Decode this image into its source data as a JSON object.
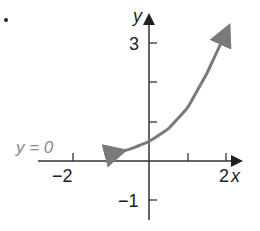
{
  "chart_data": {
    "type": "line",
    "title": "",
    "xlabel": "x",
    "ylabel": "y",
    "xlim": [
      -2.6,
      2.3
    ],
    "ylim": [
      -1.6,
      3.6
    ],
    "x_ticks": [
      -2,
      -1,
      1,
      2
    ],
    "x_tick_labels": [
      "−2",
      "2"
    ],
    "y_ticks": [
      -1,
      1,
      2,
      3
    ],
    "y_tick_labels": [
      "−1",
      "3"
    ],
    "grid": false,
    "asymptote": {
      "label": "y = 0",
      "y": 0
    },
    "series": [
      {
        "name": "curve",
        "color": "#7a7a7a",
        "x": [
          -0.7,
          -0.5,
          0,
          0.5,
          1,
          1.5,
          2.05
        ],
        "y": [
          0.25,
          0.3,
          0.5,
          0.82,
          1.36,
          2.24,
          3.4
        ]
      }
    ]
  },
  "labels": {
    "y_axis": "y",
    "x_axis": "x",
    "tick_neg2": "−2",
    "tick_2": "2",
    "tick_3": "3",
    "tick_neg1": "−1",
    "asymptote": "y = 0"
  },
  "colors": {
    "axis": "#333333",
    "curve": "#7a7a7a",
    "asymptote_label": "#8a8a8a"
  }
}
